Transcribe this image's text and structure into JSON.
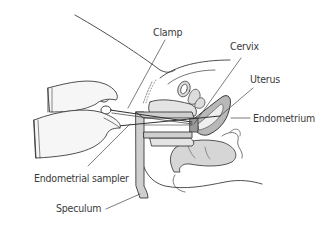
{
  "figure": {
    "labels": [
      {
        "id": "clamp",
        "text": "Clamp"
      },
      {
        "id": "cervix",
        "text": "Cervix"
      },
      {
        "id": "uterus",
        "text": "Uterus"
      },
      {
        "id": "endometrium",
        "text": "Endometrium"
      },
      {
        "id": "endometrial-sampler",
        "text": "Endometrial sampler"
      },
      {
        "id": "speculum",
        "text": "Speculum"
      }
    ],
    "colors": {
      "line": "#3c3c3c",
      "fill_light": "#e6e6e6",
      "fill_mid": "#c8c8c8",
      "fill_dark": "#8a8a8a",
      "text": "#3a3a3a",
      "background": "#ffffff"
    }
  }
}
